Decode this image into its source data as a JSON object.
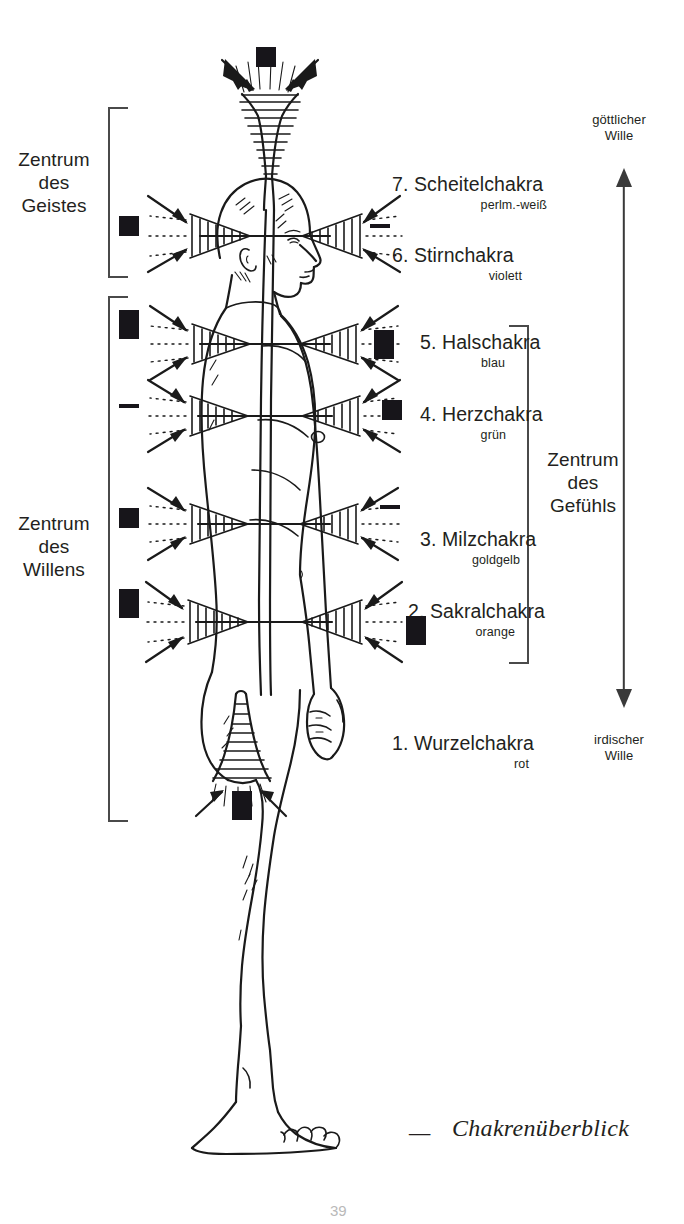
{
  "page": {
    "title": "Chakrenüberblick",
    "folio": "39",
    "caption_dash": "—",
    "ink_color": "#1a1a1a",
    "background": "#ffffff"
  },
  "groups": {
    "left": [
      {
        "id": "zentrum-des-geistes",
        "label": "Zentrum\ndes\nGeistes"
      },
      {
        "id": "zentrum-des-willens",
        "label": "Zentrum\ndes\nWillens"
      }
    ],
    "right": [
      {
        "id": "zentrum-des-gefuehls",
        "label": "Zentrum\ndes\nGefühls"
      }
    ]
  },
  "axis": {
    "top_label": "göttlicher\nWille",
    "bottom_label": "irdischer\nWille"
  },
  "chakras": [
    {
      "number": "7.",
      "name": "7. Scheitelchakra",
      "color_name": "perlm.-weiß",
      "polarity_left": "+",
      "polarity_right": "",
      "orientation": "up"
    },
    {
      "number": "6.",
      "name": "6. Stirnchakra",
      "color_name": "violett",
      "polarity_left": "+",
      "polarity_right": "−",
      "orientation": "horizontal"
    },
    {
      "number": "5.",
      "name": "5. Halschakra",
      "color_name": "blau",
      "polarity_left": "−+",
      "polarity_right": "+−",
      "orientation": "horizontal"
    },
    {
      "number": "4.",
      "name": "4. Herzchakra",
      "color_name": "grün",
      "polarity_left": "−",
      "polarity_right": "+",
      "orientation": "horizontal"
    },
    {
      "number": "3.",
      "name": "3. Milzchakra",
      "color_name": "goldgelb",
      "polarity_left": "+",
      "polarity_right": "−",
      "orientation": "horizontal"
    },
    {
      "number": "2.",
      "name": "2. Sakralchakra",
      "color_name": "orange",
      "polarity_left": "−+",
      "polarity_right": "−+",
      "orientation": "horizontal"
    },
    {
      "number": "1.",
      "name": "1. Wurzelchakra",
      "color_name": "rot",
      "polarity_left": "+",
      "polarity_right": "−",
      "orientation": "down"
    }
  ]
}
